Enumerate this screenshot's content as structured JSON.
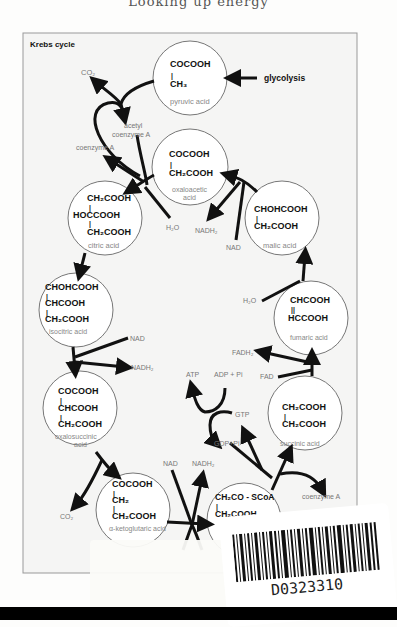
{
  "page": {
    "header_text": "Looking up energy"
  },
  "diagram": {
    "title": "Krebs cycle",
    "molecules": [
      {
        "id": "pyruvic",
        "formula": [
          "COCOOH",
          "|",
          "CH₃"
        ],
        "name": "pyruvic acid"
      },
      {
        "id": "oxaloacetic",
        "formula": [
          "COCOOH",
          "|",
          "CH₂COOH"
        ],
        "name": "oxaloacetic acid"
      },
      {
        "id": "citric",
        "formula": [
          "CH₂COOH",
          "|",
          "HOCCOOH",
          "|",
          "CH₂COOH"
        ],
        "name": "citric acid"
      },
      {
        "id": "malic",
        "formula": [
          "CHOHCOOH",
          "|",
          "CH₂COOH"
        ],
        "name": "malic acid"
      },
      {
        "id": "isocitric",
        "formula": [
          "CHOHCOOH",
          "|",
          "CHCOOH",
          "|",
          "CH₂COOH"
        ],
        "name": "isocitric acid"
      },
      {
        "id": "fumaric",
        "formula": [
          "CHCOOH",
          "||",
          "HCCOOH"
        ],
        "name": "fumaric acid"
      },
      {
        "id": "oxalosuccinic",
        "formula": [
          "COCOOH",
          "|",
          "CHCOOH",
          "|",
          "CH₂COOH"
        ],
        "name": "oxalosuccinic acid"
      },
      {
        "id": "succinic",
        "formula": [
          "CH₂COOH",
          "|",
          "CH₂COOH"
        ],
        "name": "succinic acid"
      },
      {
        "id": "ketoglutaric",
        "formula": [
          "COCOOH",
          "|",
          "CH₂",
          "|",
          "CH₂COOH"
        ],
        "name": "α-ketoglutaric acid"
      },
      {
        "id": "succinylcoa",
        "formula": [
          "CH₂CO - SCoA",
          "|",
          "CH₂COOH"
        ],
        "name": ""
      }
    ],
    "labels": {
      "glycolysis": "glycolysis",
      "co2_top": "CO₂",
      "acetyl_coa_1": "acetyl",
      "acetyl_coa_2": "coenzyme A",
      "coenzyme_a_left": "coenzyme A",
      "h2o_citric": "H₂O",
      "nadh2_malic": "NADH₂",
      "nad_malic": "NAD",
      "h2o_fumaric": "H₂O",
      "nad_iso": "NAD",
      "nadh2_iso": "NADH₂",
      "fadh2": "FADH₂",
      "fad": "FAD",
      "atp": "ATP",
      "adp_pi": "ADP + Pi",
      "gtp": "GTP",
      "gdp_pi": "GDP+Pi",
      "nad_keto": "NAD",
      "nadh2_keto": "NADH₂",
      "coenzyme_a_right": "coenzyme A",
      "co2_bottom": "CO₂"
    }
  },
  "barcode": {
    "code": "D0323310"
  }
}
